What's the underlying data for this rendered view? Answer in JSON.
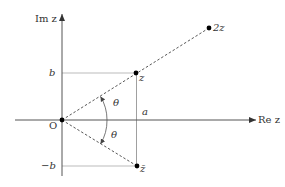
{
  "diagram": {
    "axes": {
      "real_label": "Re z",
      "imag_label": "Im z",
      "origin_label": "O"
    },
    "points": {
      "z": {
        "label": "z",
        "px": [
          136,
          73
        ]
      },
      "two_z": {
        "label": "2z",
        "px": [
          209,
          28
        ]
      },
      "z_conj": {
        "label": "z̄",
        "px": [
          137,
          166
        ]
      },
      "origin": {
        "label": "O",
        "px": [
          62,
          120
        ]
      }
    },
    "tick_labels": {
      "b": "b",
      "neg_b": "−b",
      "a": "a"
    },
    "angles": {
      "upper": "θ",
      "lower": "θ"
    },
    "colors": {
      "axis": "#333333",
      "guide": "#999999",
      "dashed": "#444444",
      "point": "#000000",
      "text": "#333333"
    }
  }
}
